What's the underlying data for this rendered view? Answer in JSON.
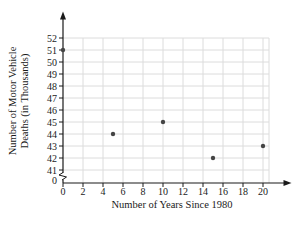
{
  "chart_data": {
    "type": "scatter",
    "title": "",
    "xlabel": "Number of Years Since 1980",
    "ylabel_line1": "Number of Motor Vehicle",
    "ylabel_line2": "Deaths (in Thousands)",
    "points": [
      {
        "x": 0,
        "y": 51
      },
      {
        "x": 5,
        "y": 44
      },
      {
        "x": 10,
        "y": 45
      },
      {
        "x": 15,
        "y": 42
      },
      {
        "x": 20,
        "y": 43
      }
    ],
    "x_ticks": [
      0,
      2,
      4,
      6,
      8,
      10,
      12,
      14,
      16,
      18,
      20
    ],
    "y_ticks": [
      41,
      42,
      43,
      44,
      45,
      46,
      47,
      48,
      49,
      50,
      51,
      52
    ],
    "y_origin_label": "0",
    "xlim": [
      0,
      20.6
    ],
    "ylim_displayed": [
      41,
      52
    ],
    "axis_break_on_y": true,
    "grid": true,
    "legend": "none",
    "colors": {
      "background": "#ffffff",
      "axis": "#1a1a1a",
      "grid": "#dcdcdc",
      "point": "#454545",
      "text": "#1a1a1a"
    }
  }
}
